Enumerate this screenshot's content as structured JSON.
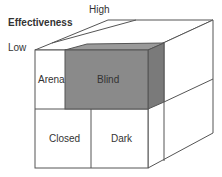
{
  "axis": {
    "title": "Effectiveness",
    "high_label": "High",
    "low_label": "Low"
  },
  "cells": {
    "arena": "Arena",
    "blind": "Blind",
    "closed": "Closed",
    "dark": "Dark"
  },
  "colors": {
    "blind_front": "#8a8a8a",
    "blind_side": "#7a7a7a",
    "blind_top": "#9a9a9a",
    "line": "#555555"
  }
}
